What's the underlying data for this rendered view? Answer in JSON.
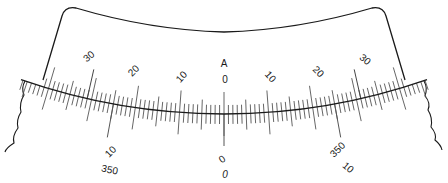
{
  "diagram": {
    "type": "curved-scale",
    "colors": {
      "ink": "#1a1a1a",
      "tick": "#555555",
      "background": "#ffffff"
    },
    "index_mark": "A",
    "upper_scale": {
      "labels": [
        {
          "text": "30",
          "side": "left"
        },
        {
          "text": "20",
          "side": "left"
        },
        {
          "text": "10",
          "side": "left"
        },
        {
          "text": "0",
          "side": "center"
        },
        {
          "text": "10",
          "side": "right"
        },
        {
          "text": "20",
          "side": "right"
        },
        {
          "text": "30",
          "side": "right"
        }
      ]
    },
    "lower_scale": {
      "row1": {
        "left": "10",
        "center": "0",
        "right": "350"
      },
      "row2": {
        "left": "350",
        "center": "0",
        "right": "10"
      }
    }
  }
}
